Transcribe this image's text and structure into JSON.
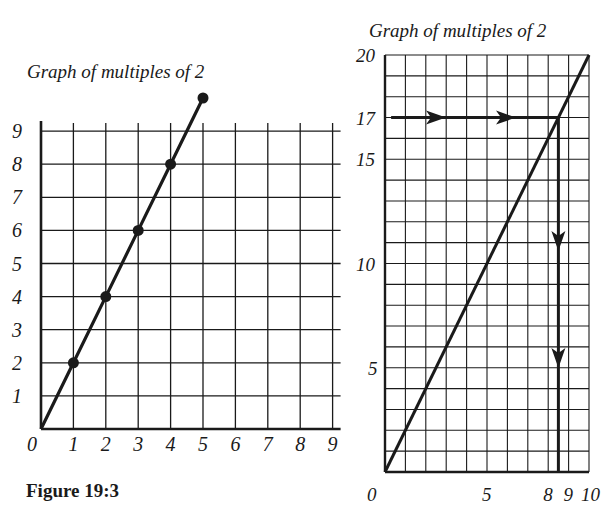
{
  "figure_caption": "Figure 19:3",
  "chart_data": [
    {
      "type": "line",
      "title": "Graph of multiples of 2",
      "xlabel": "",
      "ylabel": "",
      "xlim": [
        0,
        9
      ],
      "ylim": [
        0,
        9
      ],
      "x_ticks": [
        "0",
        "1",
        "2",
        "3",
        "4",
        "5",
        "6",
        "7",
        "8",
        "9"
      ],
      "y_ticks": [
        "1",
        "2",
        "3",
        "4",
        "5",
        "6",
        "7",
        "8",
        "9"
      ],
      "grid": true,
      "series": [
        {
          "name": "y = 2x",
          "x": [
            0,
            1,
            2,
            3,
            4,
            5
          ],
          "y": [
            0,
            2,
            4,
            6,
            8,
            10
          ],
          "markers": [
            [
              1,
              2
            ],
            [
              2,
              4
            ],
            [
              3,
              6
            ],
            [
              4,
              8
            ],
            [
              5,
              10
            ]
          ]
        }
      ]
    },
    {
      "type": "line",
      "title": "Graph of multiples of 2",
      "xlabel": "",
      "ylabel": "",
      "xlim": [
        0,
        10
      ],
      "ylim": [
        0,
        20
      ],
      "x_ticks": [
        "0",
        "5",
        "8",
        "9",
        "10"
      ],
      "y_ticks": [
        "5",
        "10",
        "15",
        "17",
        "20"
      ],
      "grid": true,
      "series": [
        {
          "name": "y = 2x",
          "x": [
            0,
            10
          ],
          "y": [
            0,
            20
          ]
        }
      ],
      "annotations": [
        {
          "type": "arrow-path",
          "description": "Horizontal line from y-axis at 17 to the graph line, arrows pointing right",
          "from": [
            0.3,
            17
          ],
          "to": [
            8.5,
            17
          ]
        },
        {
          "type": "arrow-path",
          "description": "Vertical line from graph at (8.5, 17) down to x-axis, arrows pointing down",
          "from": [
            8.5,
            17
          ],
          "to": [
            8.5,
            0
          ]
        }
      ]
    }
  ]
}
